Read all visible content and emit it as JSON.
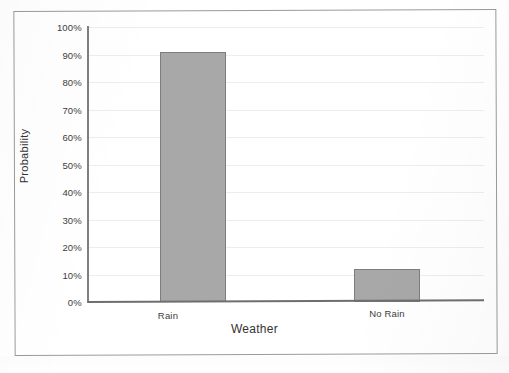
{
  "chart_data": {
    "type": "bar",
    "title": "",
    "xlabel": "Weather",
    "ylabel": "Probability",
    "categories": [
      "Rain",
      "No Rain"
    ],
    "values": [
      91,
      12
    ],
    "value_labels": [
      "91%",
      "12%"
    ],
    "ylim": [
      0,
      100
    ],
    "ytick_labels": [
      "100%",
      "90%",
      "80%",
      "70%",
      "60%",
      "50%",
      "40%",
      "30%",
      "20%",
      "10%",
      "0%"
    ],
    "ytick_values": [
      100,
      90,
      80,
      70,
      60,
      50,
      40,
      30,
      20,
      10,
      0
    ],
    "grid": true,
    "grid_axis": "y",
    "legend": false,
    "legend_position": "none",
    "bar_fill_color": "#a8a8a8",
    "bar_border_color": "#7d7d7d",
    "gridline_color": "#ededed",
    "axis_color": "#7f7f7f",
    "text_color": "#3d3d3d",
    "frame_color": "#9a9a9a",
    "background_color": "#ffffff"
  }
}
